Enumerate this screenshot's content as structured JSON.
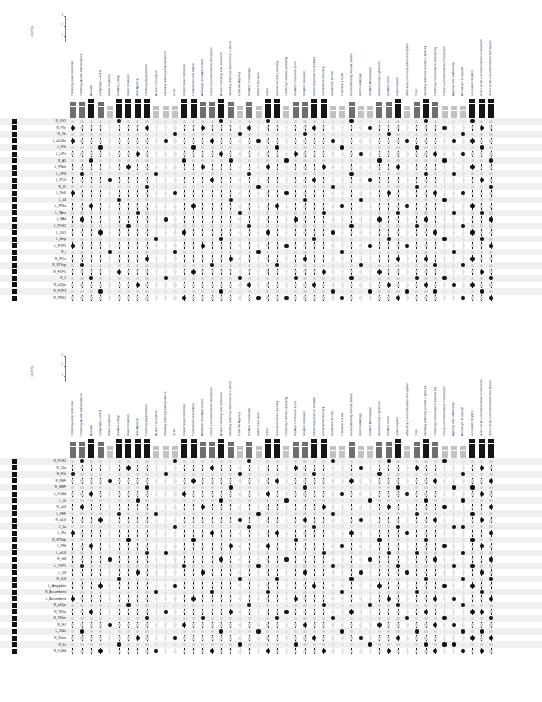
{
  "figure": {
    "caption": "",
    "count_axis": {
      "title": "count by",
      "ticks": [
        "3",
        "2",
        "1"
      ]
    },
    "dot_on_color": "#111111",
    "dot_off_color": "#cfcfcf",
    "row_marker_color": "#111111"
  },
  "columns": [
    {
      "label": "Planning-Goal Selection",
      "count": 2
    },
    {
      "label": "Planning-Active Maintenance",
      "count": 2
    },
    {
      "label": "Arousal",
      "count": 3
    },
    {
      "label": "Language Control",
      "count": 2
    },
    {
      "label": "Motor Initiation",
      "count": 1
    },
    {
      "label": "Reward Delay",
      "count": 3
    },
    {
      "label": "Motor Initiation",
      "count": 3
    },
    {
      "label": "Self Agency",
      "count": 3
    },
    {
      "label": "Planning-suppression",
      "count": 3
    },
    {
      "label": "Action Perception",
      "count": 1
    },
    {
      "label": "Working Memory Maintenance",
      "count": 1
    },
    {
      "label": "Grief",
      "count": 1
    },
    {
      "label": "Innate Motor Behavior",
      "count": 3
    },
    {
      "label": "Frustrative Nonreward",
      "count": 3
    },
    {
      "label": "Affiliation and Attachment",
      "count": 2
    },
    {
      "label": "Facial Communication-Reception",
      "count": 2
    },
    {
      "label": "Action Planning and Selection",
      "count": 3
    },
    {
      "label": "Working Memory Interference Control",
      "count": 2
    },
    {
      "label": "External Agency",
      "count": 1
    },
    {
      "label": "Reward Probability",
      "count": 2
    },
    {
      "label": "Motor Execution",
      "count": 1
    },
    {
      "label": "Habit",
      "count": 3
    },
    {
      "label": "Reinforcement Learning",
      "count": 3
    },
    {
      "label": "Planning-Flexible Updating",
      "count": 1
    },
    {
      "label": "Reward Prediction Error",
      "count": 2
    },
    {
      "label": "Reward Satiation",
      "count": 2
    },
    {
      "label": "Initial Response to Reward",
      "count": 3
    },
    {
      "label": "Declarative Memory",
      "count": 3
    },
    {
      "label": "Sustained Threat",
      "count": 1
    },
    {
      "label": "Potential Threat",
      "count": 1
    },
    {
      "label": "Understanding Mental States",
      "count": 2
    },
    {
      "label": "Self Knowledge",
      "count": 1
    },
    {
      "label": "Reward Anticipation",
      "count": 1
    },
    {
      "label": "Sensorimotor Dynamics",
      "count": 2
    },
    {
      "label": "Reward Effort",
      "count": 2
    },
    {
      "label": "Interoception",
      "count": 3
    },
    {
      "label": "Olfactory Communication-Reception",
      "count": 1
    },
    {
      "label": "Fear",
      "count": 2
    },
    {
      "label": "Working Memory Limited Capacity",
      "count": 3
    },
    {
      "label": "Planning-Performance Monitoring",
      "count": 2
    },
    {
      "label": "Facial Communication-Production",
      "count": 1
    },
    {
      "label": "Agency and Ownership",
      "count": 1
    },
    {
      "label": "Animacy Perception",
      "count": 1
    },
    {
      "label": "Circadian Rhythm",
      "count": 3
    },
    {
      "label": "Non-Facial Communication-Production",
      "count": 3
    },
    {
      "label": "Non-Facial Communication-Reception",
      "count": 3
    }
  ],
  "panel1": {
    "rows": [
      {
        "label": "R_OV1",
        "on": [
          6,
          17,
          22,
          31,
          39,
          44
        ]
      },
      {
        "label": "R_PTe",
        "on": [
          1,
          9,
          15,
          20,
          27,
          33,
          41,
          45
        ]
      },
      {
        "label": "R_7m",
        "on": [
          12,
          19,
          26,
          35,
          43
        ]
      },
      {
        "label": "L_a9-46v",
        "on": [
          1,
          11,
          16,
          21,
          29,
          37,
          42,
          44
        ]
      },
      {
        "label": "L_PGi",
        "on": [
          4,
          14,
          23,
          30,
          38,
          45
        ]
      },
      {
        "label": "L_LIPv",
        "on": [
          8,
          17,
          25,
          32,
          40,
          43
        ]
      },
      {
        "label": "R_A5",
        "on": [
          3,
          13,
          18,
          24,
          34,
          41,
          46
        ]
      },
      {
        "label": "L_PBelt",
        "on": [
          7,
          15,
          22,
          28,
          36,
          44
        ]
      },
      {
        "label": "L_LIP8",
        "on": [
          2,
          10,
          20,
          31,
          39,
          42
        ]
      },
      {
        "label": "L_PCV",
        "on": [
          5,
          16,
          27,
          33,
          45
        ]
      },
      {
        "label": "R_25",
        "on": [
          9,
          21,
          29,
          38,
          46
        ]
      },
      {
        "label": "L_PeS",
        "on": [
          1,
          12,
          24,
          35,
          40,
          43
        ]
      },
      {
        "label": "L_44",
        "on": [
          6,
          18,
          26,
          32,
          41
        ]
      },
      {
        "label": "L_7PSo",
        "on": [
          3,
          14,
          23,
          30,
          37,
          44
        ]
      },
      {
        "label": "L_TAvo",
        "on": [
          8,
          19,
          28,
          36,
          42,
          45
        ]
      },
      {
        "label": "L_8Ad",
        "on": [
          2,
          11,
          25,
          34,
          39,
          46
        ]
      },
      {
        "label": "L_POS2",
        "on": [
          7,
          20,
          31,
          38,
          43
        ]
      },
      {
        "label": "L_OV1",
        "on": [
          4,
          13,
          22,
          29,
          40,
          44
        ]
      },
      {
        "label": "L_6mp",
        "on": [
          10,
          17,
          27,
          35,
          41,
          45
        ]
      },
      {
        "label": "L_FOP5",
        "on": [
          1,
          15,
          24,
          33,
          37,
          46
        ]
      },
      {
        "label": "R_i",
        "on": [
          5,
          12,
          21,
          30,
          42
        ]
      },
      {
        "label": "R_IPCv",
        "on": [
          9,
          18,
          26,
          36,
          39,
          44
        ]
      },
      {
        "label": "R_STSvp",
        "on": [
          2,
          16,
          23,
          32,
          40,
          43
        ]
      },
      {
        "label": "R_FOP5",
        "on": [
          6,
          14,
          28,
          34,
          45
        ]
      },
      {
        "label": "R_2",
        "on": [
          3,
          11,
          19,
          25,
          31,
          38,
          41,
          46
        ]
      },
      {
        "label": "R_a32pr",
        "on": [
          8,
          20,
          27,
          35,
          39,
          42,
          44
        ]
      },
      {
        "label": "R_FOP3",
        "on": [
          4,
          17,
          29,
          33,
          37,
          40,
          45
        ]
      },
      {
        "label": "R_PRS1",
        "on": [
          13,
          21,
          24,
          30,
          36,
          43,
          46
        ]
      }
    ]
  },
  "panel2": {
    "rows": [
      {
        "label": "R_POS2",
        "on": [
          2,
          12,
          20,
          29,
          35,
          41
        ]
      },
      {
        "label": "R_51a",
        "on": [
          7,
          16,
          25,
          32,
          38,
          45
        ]
      },
      {
        "label": "R_FGi",
        "on": [
          1,
          11,
          19,
          27,
          34,
          43
        ]
      },
      {
        "label": "R_REF",
        "on": [
          5,
          14,
          23,
          31,
          40,
          46
        ]
      },
      {
        "label": "R_WEF",
        "on": [
          9,
          18,
          26,
          36,
          42,
          44
        ]
      },
      {
        "label": "L_9-46d",
        "on": [
          3,
          13,
          22,
          30,
          37,
          45
        ]
      },
      {
        "label": "L_6r",
        "on": [
          8,
          17,
          24,
          33,
          39,
          43
        ]
      },
      {
        "label": "R_a23",
        "on": [
          2,
          15,
          28,
          35,
          41,
          46
        ]
      },
      {
        "label": "L_FEF",
        "on": [
          6,
          10,
          21,
          29,
          38,
          44
        ]
      },
      {
        "label": "R_a6-8",
        "on": [
          4,
          19,
          26,
          32,
          40,
          45
        ]
      },
      {
        "label": "L_5a",
        "on": [
          12,
          20,
          27,
          36,
          42,
          43
        ]
      },
      {
        "label": "L_IFo",
        "on": [
          1,
          16,
          23,
          31,
          37,
          46
        ]
      },
      {
        "label": "R_STSdp",
        "on": [
          7,
          14,
          25,
          34,
          39,
          44
        ]
      },
      {
        "label": "L_PHi",
        "on": [
          3,
          18,
          22,
          30,
          41,
          45
        ]
      },
      {
        "label": "L_a6-8",
        "on": [
          9,
          11,
          28,
          35,
          38,
          43
        ]
      },
      {
        "label": "R_r68",
        "on": [
          5,
          17,
          24,
          33,
          40,
          46
        ]
      },
      {
        "label": "L_7OP5",
        "on": [
          2,
          13,
          21,
          29,
          36,
          42,
          44
        ]
      },
      {
        "label": "L_V8",
        "on": [
          8,
          15,
          26,
          32,
          37,
          45
        ]
      },
      {
        "label": "R_i6-8",
        "on": [
          6,
          19,
          23,
          31,
          39,
          43,
          46
        ]
      },
      {
        "label": "L_Amygdala",
        "on": [
          4,
          12,
          27,
          34,
          41,
          44
        ]
      },
      {
        "label": "R_Accumbens",
        "on": [
          10,
          16,
          22,
          30,
          38,
          45
        ]
      },
      {
        "label": "L_Accumbens",
        "on": [
          1,
          14,
          25,
          35,
          40,
          42,
          46
        ]
      },
      {
        "label": "R_p32pr",
        "on": [
          7,
          20,
          28,
          33,
          36,
          43
        ]
      },
      {
        "label": "R_TE1p",
        "on": [
          3,
          11,
          18,
          24,
          31,
          39,
          44,
          45
        ]
      },
      {
        "label": "R_TE1m",
        "on": [
          9,
          15,
          23,
          29,
          37,
          41,
          46
        ]
      },
      {
        "label": "R_IFJ",
        "on": [
          5,
          13,
          26,
          34,
          40,
          42
        ]
      },
      {
        "label": "L_23dv",
        "on": [
          2,
          17,
          21,
          30,
          38,
          43,
          45
        ]
      },
      {
        "label": "R_31ets",
        "on": [
          8,
          12,
          27,
          32,
          36,
          44,
          46
        ]
      },
      {
        "label": "R_6v",
        "on": [
          6,
          19,
          25,
          33,
          39,
          41,
          42
        ]
      },
      {
        "label": "R_9-46d",
        "on": [
          4,
          10,
          16,
          22,
          28,
          35,
          40,
          43,
          45
        ]
      }
    ]
  }
}
